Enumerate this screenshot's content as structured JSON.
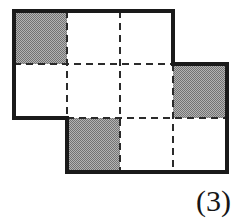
{
  "figure": {
    "caption": "(3)",
    "type": "polyomino-grid-diagram",
    "colors": {
      "outline": "#1a1a1a",
      "dashed_interior": "#2b2b2b",
      "shaded_fill": "#999999",
      "empty_fill": "#ffffff",
      "background": "#ffffff",
      "caption": "#161616"
    },
    "grid": {
      "columns": 4,
      "rows": 3,
      "cell_width": 53,
      "cell_height": 53.5,
      "origin_x": 14,
      "origin_y": 11,
      "column_edges_px": [
        14,
        67,
        120,
        173,
        227
      ],
      "row_edges_px": [
        11,
        64,
        118,
        172
      ]
    },
    "cells": [
      {
        "row": 1,
        "col": 1,
        "present": true,
        "shaded": true,
        "x": 14,
        "y": 11,
        "w": 53,
        "h": 53
      },
      {
        "row": 1,
        "col": 2,
        "present": true,
        "shaded": false,
        "x": 67,
        "y": 11,
        "w": 53,
        "h": 53
      },
      {
        "row": 1,
        "col": 3,
        "present": true,
        "shaded": false,
        "x": 120,
        "y": 11,
        "w": 53,
        "h": 53
      },
      {
        "row": 1,
        "col": 4,
        "present": false,
        "shaded": false,
        "x": 173,
        "y": 11,
        "w": 54,
        "h": 53
      },
      {
        "row": 2,
        "col": 1,
        "present": true,
        "shaded": false,
        "x": 14,
        "y": 64,
        "w": 53,
        "h": 54
      },
      {
        "row": 2,
        "col": 2,
        "present": true,
        "shaded": false,
        "x": 67,
        "y": 64,
        "w": 53,
        "h": 54
      },
      {
        "row": 2,
        "col": 3,
        "present": true,
        "shaded": false,
        "x": 120,
        "y": 64,
        "w": 53,
        "h": 54
      },
      {
        "row": 2,
        "col": 4,
        "present": true,
        "shaded": true,
        "x": 173,
        "y": 64,
        "w": 54,
        "h": 54
      },
      {
        "row": 3,
        "col": 1,
        "present": false,
        "shaded": false,
        "x": 14,
        "y": 118,
        "w": 53,
        "h": 54
      },
      {
        "row": 3,
        "col": 2,
        "present": true,
        "shaded": true,
        "x": 67,
        "y": 118,
        "w": 53,
        "h": 54
      },
      {
        "row": 3,
        "col": 3,
        "present": true,
        "shaded": false,
        "x": 120,
        "y": 118,
        "w": 53,
        "h": 54
      },
      {
        "row": 3,
        "col": 4,
        "present": true,
        "shaded": false,
        "x": 173,
        "y": 118,
        "w": 54,
        "h": 54
      }
    ],
    "counts": {
      "total_squares": 9,
      "shaded_squares": 3,
      "unshaded_squares": 6
    },
    "outline_path": "M 14 11 L 173 11 L 173 64 L 227 64 L 227 172 L 67 172 L 67 118 L 14 118 Z",
    "interior_dashed_segments": [
      {
        "name": "v-col2-row1-2",
        "x1": 67,
        "y1": 11,
        "x2": 67,
        "y2": 118
      },
      {
        "name": "v-col3-full",
        "x1": 120,
        "y1": 11,
        "x2": 120,
        "y2": 172
      },
      {
        "name": "v-col4-row2-3",
        "x1": 173,
        "y1": 64,
        "x2": 173,
        "y2": 172
      },
      {
        "name": "h-row2-left",
        "x1": 14,
        "y1": 64,
        "x2": 173,
        "y2": 64
      },
      {
        "name": "h-row3-right",
        "x1": 67,
        "y1": 118,
        "x2": 227,
        "y2": 118
      }
    ]
  }
}
